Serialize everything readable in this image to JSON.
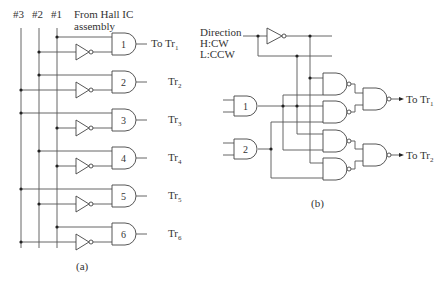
{
  "colors": {
    "line": "#555555",
    "text": "#333333",
    "background": "#ffffff"
  },
  "figure_a": {
    "caption": "(a)",
    "bus_labels": [
      "#3",
      "#2",
      "#1"
    ],
    "source_label_line1": "From Hall IC",
    "source_label_line2": "assembly",
    "bus_x": [
      21,
      39,
      57
    ],
    "bus_top": 28,
    "bus_bottom": 248,
    "gates": [
      {
        "id": "1",
        "cy": 44,
        "top_bus": 2,
        "inv_bus": 1,
        "out_prefix": "To ",
        "out_label": "Tr",
        "out_sub": "1"
      },
      {
        "id": "2",
        "cy": 82,
        "top_bus": 1,
        "inv_bus": 0,
        "out_prefix": "",
        "out_label": "Tr",
        "out_sub": "2"
      },
      {
        "id": "3",
        "cy": 120,
        "top_bus": 0,
        "inv_bus": 2,
        "out_prefix": "",
        "out_label": "Tr",
        "out_sub": "3"
      },
      {
        "id": "4",
        "cy": 158,
        "top_bus": 1,
        "inv_bus": 2,
        "out_prefix": "",
        "out_label": "Tr",
        "out_sub": "4"
      },
      {
        "id": "5",
        "cy": 196,
        "top_bus": 0,
        "inv_bus": 1,
        "out_prefix": "",
        "out_label": "Tr",
        "out_sub": "5"
      },
      {
        "id": "6",
        "cy": 234,
        "top_bus": 2,
        "inv_bus": 0,
        "out_prefix": "",
        "out_label": "Tr",
        "out_sub": "6"
      }
    ]
  },
  "figure_b": {
    "caption": "(b)",
    "direction_label": "Direction",
    "cw_label": "H:CW",
    "ccw_label": "L:CCW",
    "and_gates": [
      {
        "id": "1",
        "cy": 106
      },
      {
        "id": "2",
        "cy": 149
      }
    ],
    "outputs": [
      {
        "prefix": "To ",
        "label": "Tr",
        "sub": "1",
        "cy": 99
      },
      {
        "prefix": "To ",
        "label": "Tr",
        "sub": "2",
        "cy": 155
      }
    ]
  }
}
